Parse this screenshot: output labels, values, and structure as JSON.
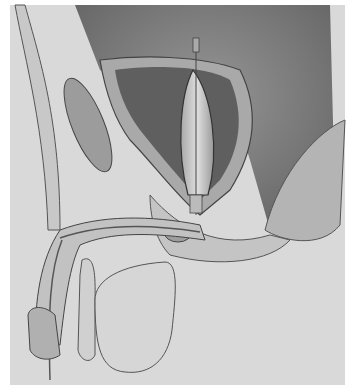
{
  "image": {
    "description": "Grayscale medical illustration: sagittal cross-section of male pelvis showing bladder with inserted balloon catheter, prostate, urethra, penis and scrotum",
    "colors": {
      "background": "#d9d9d9",
      "dark_cavity": "#6e6e6e",
      "tissue": "#bdbdbd",
      "outline": "#3a3a3a",
      "balloon": "#cfcfcf"
    }
  }
}
